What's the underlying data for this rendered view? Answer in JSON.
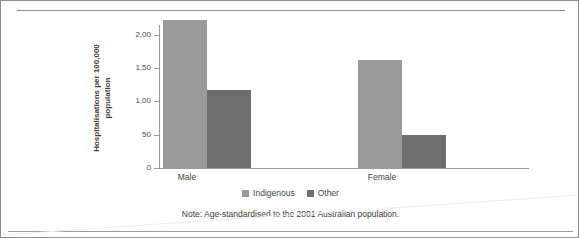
{
  "chart_data": {
    "type": "bar",
    "title": "",
    "xlabel": "",
    "ylabel": "Hospitalisations per 100,000 population",
    "ylabel_line1": "Hospitalisations per 100,000",
    "ylabel_line2": "population",
    "categories": [
      "Male",
      "Female"
    ],
    "series": [
      {
        "name": "Indigenous",
        "color": "#9a9a9a",
        "values": [
          2.22,
          1.62
        ]
      },
      {
        "name": "Other",
        "color": "#6e6e6e",
        "values": [
          1.17,
          0.5
        ]
      }
    ],
    "ylim": [
      0,
      2.4
    ],
    "yticks": [
      0,
      0.5,
      1.0,
      1.5,
      2.0
    ],
    "ytick_labels": [
      "0",
      "50",
      "1,00",
      "1,50",
      "2,00"
    ],
    "grid": false,
    "legend_position": "bottom",
    "note": "Note: Age-standardised to the 2001 Australian population."
  },
  "legend": {
    "items": [
      {
        "label": "Indigenous",
        "color": "#9a9a9a"
      },
      {
        "label": "Other",
        "color": "#6e6e6e"
      }
    ]
  },
  "axis": {
    "tick_labels": [
      "2,00",
      "1,50",
      "1,00",
      "50",
      "0"
    ],
    "category_labels": [
      "Male",
      "Female"
    ]
  },
  "note": {
    "text": "Note: Age-standardised to the 2001 Australian population."
  }
}
